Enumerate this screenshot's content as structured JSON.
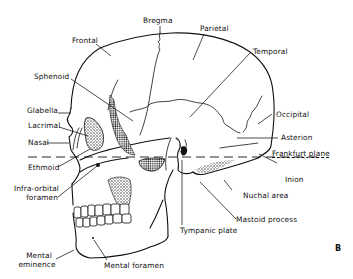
{
  "figure": {
    "panel_letter": "B",
    "reference_line": "Frankfurt plane"
  },
  "labels": {
    "bregma": "Bregma",
    "parietal": "Parietal",
    "frontal": "Frontal",
    "temporal": "Temporal",
    "sphenoid": "Sphenoid",
    "glabella": "Glabella",
    "lacrimal": "Lacrimal",
    "occipital": "Occipital",
    "nasal": "Nasal",
    "asterion": "Asterion",
    "frankfurt_plane": "Frankfurt plane",
    "ethmoid": "Ethmoid",
    "inion": "Inion",
    "infra_orbital_1": "Infra-orbital",
    "infra_orbital_2": "foramen",
    "nuchal_area": "Nuchal area",
    "mastoid_process": "Mastoid process",
    "tympanic_plate": "Tympanic plate",
    "mental_eminence_1": "Mental",
    "mental_eminence_2": "eminence",
    "mental_foramen": "Mental foramen"
  },
  "colors": {
    "ink": "#111111",
    "background": "#ffffff"
  }
}
